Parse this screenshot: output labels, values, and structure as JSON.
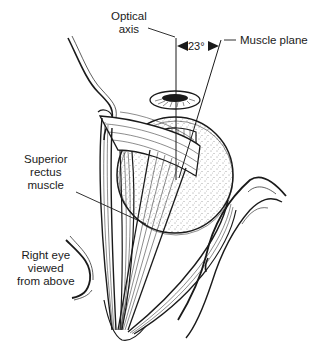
{
  "figure": {
    "labels": {
      "optical_axis_line1": "Optical",
      "optical_axis_line2": "axis",
      "angle": "23°",
      "muscle_plane": "Muscle plane",
      "superior_line1": "Superior",
      "superior_line2": "rectus",
      "superior_line3": "muscle",
      "view_line1": "Right eye",
      "view_line2": "viewed",
      "view_line3": "from above"
    },
    "angle_degrees": 23,
    "colors": {
      "ink": "#1a1a1a",
      "background": "#ffffff"
    }
  }
}
